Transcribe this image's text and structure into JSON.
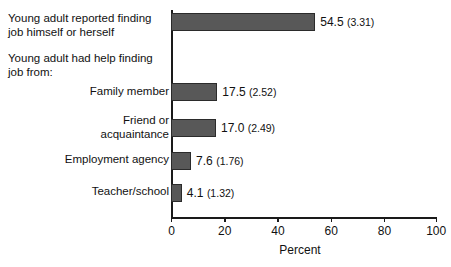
{
  "chart_data": {
    "type": "bar",
    "orientation": "horizontal",
    "title": "",
    "xlabel": "Percent",
    "ylabel": "",
    "xlim": [
      0,
      100
    ],
    "xticks": [
      0,
      20,
      40,
      60,
      80,
      100
    ],
    "grid": false,
    "legend": null,
    "group_headers": [
      {
        "text": "Young adult reported finding\njob himself or herself",
        "align": "left"
      },
      {
        "text": "Young adult had help finding\njob from:",
        "align": "left"
      }
    ],
    "categories": [
      "Young adult reported finding job himself or herself",
      "Family member",
      "Friend or acquaintance",
      "Employment agency",
      "Teacher/school"
    ],
    "values": [
      54.5,
      17.5,
      17.0,
      7.6,
      4.1
    ],
    "standard_errors": [
      3.31,
      2.52,
      2.49,
      1.76,
      1.32
    ],
    "data_labels": [
      "54.5 (3.31)",
      "17.5 (2.52)",
      "17.0 (2.49)",
      "7.6 (1.76)",
      "4.1 (1.32)"
    ],
    "bar_color": "#585858",
    "bar_edge_color": "#2b2b2b",
    "axis_color": "#1a1a1a"
  },
  "bars": [
    {
      "label_lines": "Young adult reported finding\njob himself or herself",
      "label_align": "left",
      "value": 54.5,
      "se": 3.31,
      "value_text": "54.5",
      "se_text": "(3.31)"
    },
    {
      "label_lines": "Family member",
      "label_align": "right",
      "value": 17.5,
      "se": 2.52,
      "value_text": "17.5",
      "se_text": "(2.52)"
    },
    {
      "label_lines": "Friend or\nacquaintance",
      "label_align": "right",
      "value": 17.0,
      "se": 2.49,
      "value_text": "17.0",
      "se_text": "(2.49)"
    },
    {
      "label_lines": "Employment agency",
      "label_align": "right",
      "value": 7.6,
      "se": 1.76,
      "value_text": "7.6",
      "se_text": "(1.76)"
    },
    {
      "label_lines": "Teacher/school",
      "label_align": "right",
      "value": 4.1,
      "se": 1.32,
      "value_text": "4.1",
      "se_text": "(1.32)"
    }
  ],
  "section_header": {
    "text": "Young adult had help finding\njob from:"
  },
  "axis": {
    "x_title": "Percent",
    "ticks": [
      "0",
      "20",
      "40",
      "60",
      "80",
      "100"
    ]
  }
}
